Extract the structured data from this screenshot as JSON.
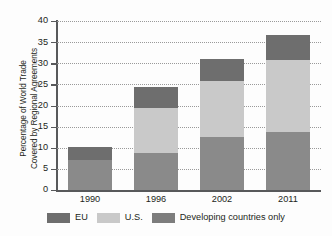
{
  "chart_data": {
    "type": "bar",
    "subtype": "stacked-vertical",
    "title": "",
    "xlabel": "",
    "ylabel": "Percentage of World Trade Covered by Regional Agreements",
    "ylabel_lines": [
      "Percentage of World Trade",
      "Covered by Regional Agreements"
    ],
    "categories": [
      "1990",
      "1996",
      "2002",
      "2011"
    ],
    "series": [
      {
        "name": "Developing countries only",
        "color": "#8a8a8a",
        "values": [
          7.2,
          8.8,
          12.6,
          13.7
        ]
      },
      {
        "name": "U.S.",
        "color": "#c9c9c9",
        "values": [
          0,
          10.5,
          13.1,
          17.1
        ]
      },
      {
        "name": "EU",
        "color": "#6e6e6e",
        "values": [
          2.9,
          5.2,
          5.3,
          5.9
        ]
      }
    ],
    "stack_order_bottom_to_top": [
      "Developing countries only",
      "U.S.",
      "EU"
    ],
    "totals": [
      10.1,
      24.5,
      31.0,
      36.7
    ],
    "ylim": [
      0,
      40
    ],
    "yticks": [
      0,
      5,
      10,
      15,
      20,
      25,
      30,
      35,
      40
    ],
    "ytick_labels": [
      "0",
      "5",
      "10",
      "15",
      "20",
      "25",
      "30",
      "35",
      "40"
    ],
    "grid": "horizontal-dotted",
    "legend_position": "bottom",
    "legend": [
      {
        "label": "EU",
        "color": "#6e6e6e"
      },
      {
        "label": "U.S.",
        "color": "#c9c9c9"
      },
      {
        "label": "Developing countries only",
        "color": "#7d7d7d"
      }
    ]
  },
  "colors": {
    "eu": "#6e6e6e",
    "us": "#c9c9c9",
    "developing": "#8a8a8a",
    "axis": "#58595b",
    "grid": "#9a9a9a",
    "text": "#231f20",
    "background": "#fdfdfd"
  }
}
